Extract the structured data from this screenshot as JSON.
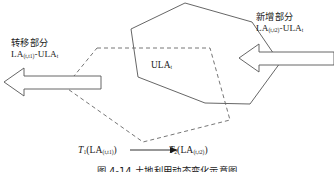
{
  "figure": {
    "width": 334,
    "height": 172,
    "background": "#ffffff",
    "line_color": "#555555",
    "text_color": "#1a1a1a"
  },
  "labels": {
    "transfer": {
      "title": "转移部分",
      "formula_main": "LA",
      "formula_sub1": "(t,t1)",
      "formula_mid": "-ULA",
      "formula_sub2": "t"
    },
    "new": {
      "title": "新增部分",
      "formula_main": "LA",
      "formula_sub1": "(t,t2)",
      "formula_mid": "-ULA",
      "formula_sub2": "t"
    },
    "center": {
      "main": "ULA",
      "sub": "t"
    }
  },
  "formula": {
    "left_fn": "T",
    "left_fn_sub": "1",
    "left_arg": "(LA",
    "left_arg_sub": "(t,t1)",
    "left_close": ")",
    "right_fn": "T",
    "right_fn_sub": "2",
    "right_arg": "(LA",
    "right_arg_sub": "(t,t2)",
    "right_close": ")"
  },
  "caption": {
    "text": "图 4-14    土地利用动态变化示意图"
  },
  "shapes": {
    "hexagon": {
      "style": "solid",
      "stroke": "#555555",
      "points": "185,3 252,22 280,63 250,104 205,103 138,77 131,29"
    },
    "dashed_polygon": {
      "style": "dashed",
      "stroke": "#666666",
      "points": "97,48 210,48 230,120 143,142 65,87"
    },
    "arrow_left": {
      "direction": "left",
      "stroke": "#555555",
      "fill": "#ffffff",
      "tip_x": 4,
      "tail_x": 101,
      "center_y": 82
    },
    "arrow_right": {
      "direction": "left",
      "stroke": "#555555",
      "fill": "#ffffff",
      "tip_x": 239,
      "tail_x": 334,
      "center_y": 58
    },
    "formula_arrow": {
      "direction": "right",
      "stroke": "#1a1a1a",
      "x1": 130,
      "x2": 176,
      "y": 150
    }
  }
}
